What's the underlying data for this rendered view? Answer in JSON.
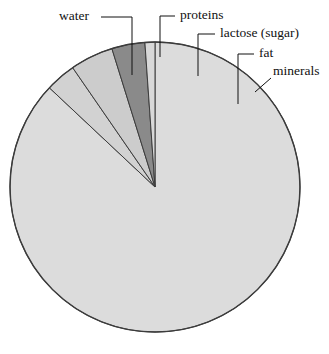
{
  "figure": {
    "background_color": "#ffffff",
    "text_color": "#111111",
    "outline_color": "#3c3c3c",
    "center_x": 155,
    "center_y": 187,
    "radius": 145
  },
  "chart_data": {
    "type": "pie",
    "title": "",
    "subtitle": "",
    "xlabel": "",
    "ylabel": "",
    "grid": false,
    "legend_position": "none",
    "label_style": "leader-lines",
    "start_angle_deg": 0,
    "direction": "clockwise",
    "categories": [
      "water",
      "proteins",
      "lactose (sugar)",
      "fat",
      "minerals"
    ],
    "values": [
      87.0,
      3.4,
      4.8,
      3.7,
      0.7
    ],
    "units": "percent",
    "slices": [
      {
        "label": "water",
        "value": 87.0,
        "color": "#dcdcdc",
        "start_deg": 0.0,
        "end_deg": 313.2
      },
      {
        "label": "proteins",
        "value": 3.4,
        "color": "#d2d2d2",
        "start_deg": 313.2,
        "end_deg": 325.4
      },
      {
        "label": "lactose (sugar)",
        "value": 4.8,
        "color": "#cccccc",
        "start_deg": 325.4,
        "end_deg": 342.7
      },
      {
        "label": "fat",
        "value": 3.7,
        "color": "#8a8a8a",
        "start_deg": 342.7,
        "end_deg": 356.0
      },
      {
        "label": "minerals",
        "value": 0.7,
        "color": "#d8d8d8",
        "start_deg": 356.0,
        "end_deg": 360.0
      }
    ]
  },
  "labels": {
    "water": {
      "text": "water",
      "text_x": 74,
      "text_y": 17,
      "anchor": "middle"
    },
    "proteins": {
      "text": "proteins",
      "text_x": 180,
      "text_y": 16,
      "anchor": "start"
    },
    "lactose": {
      "text": "lactose (sugar)",
      "text_x": 220,
      "text_y": 34,
      "anchor": "start"
    },
    "fat": {
      "text": "fat",
      "text_x": 259,
      "text_y": 54,
      "anchor": "start"
    },
    "minerals": {
      "text": "minerals",
      "text_x": 273,
      "text_y": 72,
      "anchor": "start"
    }
  }
}
